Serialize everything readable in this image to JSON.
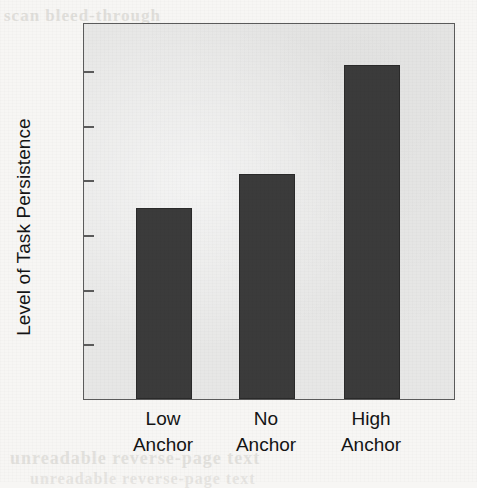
{
  "chart_data": {
    "type": "bar",
    "title": "",
    "subtitle": "",
    "xlabel": "",
    "ylabel": "Level of Task Persistence",
    "categories": [
      "Low Anchor",
      "No Anchor",
      "High Anchor"
    ],
    "category_lines": [
      [
        "Low",
        "Anchor"
      ],
      [
        "No",
        "Anchor"
      ],
      [
        "High",
        "Anchor"
      ]
    ],
    "values": [
      17.5,
      20.6,
      30.6
    ],
    "ylim": [
      0,
      34.5
    ],
    "yticks": [
      5,
      10,
      15,
      20,
      25,
      30
    ],
    "ytick_labels": [
      "5",
      "10",
      "15",
      "20",
      "25",
      "30"
    ],
    "grid": false,
    "legend": null,
    "legend_position": "none",
    "bar_color": "#3b3b3b",
    "panel_background": "#e7e7e6",
    "axis_color": "#5b5b5b",
    "text_color": "#141414",
    "page_background": "#f7f6f4"
  },
  "artifacts": {
    "bleed_top": "scan bleed-through",
    "bleed_bottom_1": "unreadable reverse-page text",
    "bleed_bottom_2": "unreadable reverse-page text"
  }
}
